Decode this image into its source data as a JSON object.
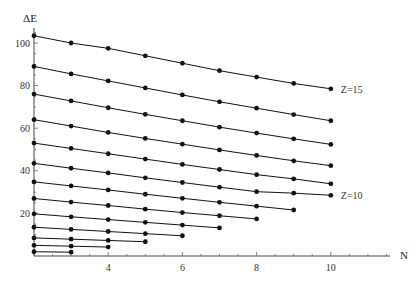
{
  "chart_data": {
    "type": "line",
    "title": "",
    "xlabel": "N",
    "ylabel": "ΔE",
    "xlim": [
      2,
      11.5
    ],
    "ylim": [
      0,
      108
    ],
    "xticks": [
      4,
      6,
      8,
      10
    ],
    "yticks": [
      20,
      40,
      60,
      80,
      100
    ],
    "grid": false,
    "legend": "none",
    "markers": true,
    "annotations": [
      {
        "text": "Z=15",
        "x": 10,
        "y": 78.5
      },
      {
        "text": "Z=10",
        "x": 10,
        "y": 28.5
      }
    ],
    "series": [
      {
        "name": "Z=3",
        "x": [
          2,
          3
        ],
        "values": [
          2.0,
          1.8
        ]
      },
      {
        "name": "Z=4",
        "x": [
          2,
          3,
          4
        ],
        "values": [
          5.0,
          4.6,
          4.2
        ]
      },
      {
        "name": "Z=5",
        "x": [
          2,
          3,
          4,
          5
        ],
        "values": [
          8.5,
          7.9,
          7.3,
          6.7
        ]
      },
      {
        "name": "Z=6",
        "x": [
          2,
          3,
          4,
          5,
          6
        ],
        "values": [
          13.5,
          12.5,
          11.5,
          10.5,
          9.5
        ]
      },
      {
        "name": "Z=7",
        "x": [
          2,
          3,
          4,
          5,
          6,
          7
        ],
        "values": [
          19.8,
          18.4,
          17.1,
          15.8,
          14.5,
          13.2
        ]
      },
      {
        "name": "Z=8",
        "x": [
          2,
          3,
          4,
          5,
          6,
          7,
          8
        ],
        "values": [
          27.0,
          25.3,
          23.7,
          22.0,
          20.4,
          18.9,
          17.4
        ]
      },
      {
        "name": "Z=9",
        "x": [
          2,
          3,
          4,
          5,
          6,
          7,
          8,
          9
        ],
        "values": [
          34.8,
          32.9,
          31.0,
          29.0,
          27.1,
          25.2,
          23.4,
          21.6
        ]
      },
      {
        "name": "Z=10",
        "x": [
          2,
          3,
          4,
          5,
          6,
          7,
          8,
          9,
          10
        ],
        "values": [
          43.5,
          41.2,
          39.0,
          36.7,
          34.5,
          32.3,
          30.2,
          29.5,
          28.5
        ]
      },
      {
        "name": "Z=11",
        "x": [
          2,
          3,
          4,
          5,
          6,
          7,
          8,
          9,
          10
        ],
        "values": [
          53.0,
          50.5,
          48.0,
          45.5,
          43.0,
          40.6,
          38.2,
          36.2,
          33.9
        ]
      },
      {
        "name": "Z=12",
        "x": [
          2,
          3,
          4,
          5,
          6,
          7,
          8,
          9,
          10
        ],
        "values": [
          64.0,
          61.0,
          58.0,
          55.2,
          52.5,
          49.8,
          47.2,
          44.7,
          42.4
        ]
      },
      {
        "name": "Z=13",
        "x": [
          2,
          3,
          4,
          5,
          6,
          7,
          8,
          9,
          10
        ],
        "values": [
          76.0,
          72.8,
          69.6,
          66.5,
          63.5,
          60.5,
          57.7,
          55.0,
          52.4
        ]
      },
      {
        "name": "Z=14",
        "x": [
          2,
          3,
          4,
          5,
          6,
          7,
          8,
          9,
          10
        ],
        "values": [
          89.0,
          85.5,
          82.2,
          78.9,
          75.6,
          72.4,
          69.4,
          66.4,
          63.5
        ]
      },
      {
        "name": "Z=15",
        "x": [
          2,
          3,
          4,
          5,
          6,
          7,
          8,
          9,
          10
        ],
        "values": [
          103.4,
          100.0,
          97.5,
          94.0,
          90.5,
          87.0,
          84.0,
          81.0,
          78.5
        ]
      }
    ]
  },
  "labels": {
    "y_axis": "ΔE",
    "x_axis": "N"
  }
}
